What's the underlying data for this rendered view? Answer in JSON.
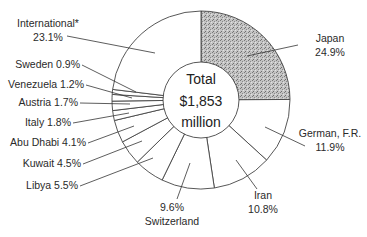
{
  "chart_data": {
    "type": "pie",
    "style": "donut",
    "title": "",
    "center_label": [
      "Total",
      "$1,853",
      "million"
    ],
    "total": 1853,
    "unit": "million USD",
    "start_angle": "12 o'clock",
    "direction": "clockwise",
    "slices": [
      {
        "label": "Japan",
        "value": 24.9,
        "display": "24.9%",
        "fill": "#bdbdbd",
        "textured": true
      },
      {
        "label": "German, F.R.",
        "value": 11.9,
        "display": "11.9%",
        "fill": "#ffffff"
      },
      {
        "label": "Iran",
        "value": 10.8,
        "display": "10.8%",
        "fill": "#ffffff"
      },
      {
        "label": "Switzerland",
        "value": 9.6,
        "display": "9.6%",
        "fill": "#ffffff"
      },
      {
        "label": "Libya",
        "value": 5.5,
        "display": "5.5%",
        "fill": "#ffffff"
      },
      {
        "label": "Kuwait",
        "value": 4.5,
        "display": "4.5%",
        "fill": "#ffffff"
      },
      {
        "label": "Abu Dhabi",
        "value": 4.1,
        "display": "4.1%",
        "fill": "#ffffff"
      },
      {
        "label": "Italy",
        "value": 1.8,
        "display": "1.8%",
        "fill": "#ffffff"
      },
      {
        "label": "Austria",
        "value": 1.7,
        "display": "1.7%",
        "fill": "#ffffff"
      },
      {
        "label": "Venezuela",
        "value": 1.2,
        "display": "1.2%",
        "fill": "#ffffff"
      },
      {
        "label": "Sweden",
        "value": 0.9,
        "display": "0.9%",
        "fill": "#ffffff"
      },
      {
        "label": "International*",
        "value": 23.1,
        "display": "23.1%",
        "fill": "#ffffff"
      }
    ],
    "legend": "none (direct labels with leader lines)"
  },
  "labels": [
    {
      "text": [
        "Japan",
        "24.9%"
      ],
      "x": 330,
      "y": 42,
      "anchor": "middle",
      "line": [
        [
          298,
          45
        ],
        [
          247,
          56
        ]
      ]
    },
    {
      "text": [
        "German, F.R.",
        "11.9%"
      ],
      "x": 330,
      "y": 137,
      "anchor": "middle",
      "line": [
        [
          305,
          146
        ],
        [
          265,
          127
        ]
      ]
    },
    {
      "text": [
        "Iran",
        "10.8%"
      ],
      "x": 263,
      "y": 199,
      "anchor": "middle",
      "line": [
        [
          257,
          189
        ],
        [
          236,
          160
        ]
      ]
    },
    {
      "text": [
        "9.6%",
        "Switzerland"
      ],
      "x": 172,
      "y": 211,
      "anchor": "middle",
      "line": [
        [
          177,
          199
        ],
        [
          190,
          163
        ]
      ]
    },
    {
      "text": [
        "Libya 5.5%"
      ],
      "x": 78,
      "y": 189,
      "anchor": "end",
      "line": [
        [
          80,
          186
        ],
        [
          153,
          158
        ]
      ]
    },
    {
      "text": [
        "Kuwait 4.5%"
      ],
      "x": 81,
      "y": 167,
      "anchor": "end",
      "line": [
        [
          83,
          164
        ],
        [
          142,
          141
        ]
      ]
    },
    {
      "text": [
        "Abu Dhabi 4.1%"
      ],
      "x": 86,
      "y": 146,
      "anchor": "end",
      "line": [
        [
          88,
          143
        ],
        [
          134,
          126
        ]
      ]
    },
    {
      "text": [
        "Italy 1.8%"
      ],
      "x": 71,
      "y": 126,
      "anchor": "end",
      "line": [
        [
          73,
          123
        ],
        [
          129,
          113
        ]
      ]
    },
    {
      "text": [
        "Austria 1.7%"
      ],
      "x": 78,
      "y": 106,
      "anchor": "end",
      "line": [
        [
          80,
          103
        ],
        [
          130,
          104
        ]
      ]
    },
    {
      "text": [
        "Venezuela 1.2%"
      ],
      "x": 84,
      "y": 88,
      "anchor": "end",
      "line": [
        [
          86,
          85
        ],
        [
          132,
          98
        ]
      ]
    },
    {
      "text": [
        "Sweden 0.9%"
      ],
      "x": 80,
      "y": 68,
      "anchor": "end",
      "line": [
        [
          82,
          65
        ],
        [
          136,
          92
        ]
      ]
    },
    {
      "text": [
        "International*",
        "23.1%"
      ],
      "x": 48,
      "y": 27,
      "anchor": "middle",
      "line": [
        [
          67,
          36
        ],
        [
          155,
          53
        ]
      ]
    }
  ],
  "geometry": {
    "cx": 201,
    "cy": 100,
    "r_outer": 89,
    "r_inner": 38
  }
}
